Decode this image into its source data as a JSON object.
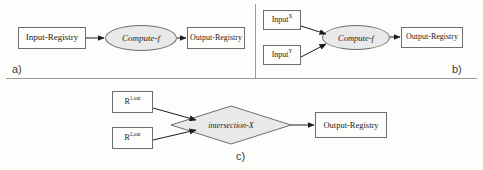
{
  "figure": {
    "background_color": "#fdfdfc",
    "stroke_color": "#6e6e6e",
    "fill_gray": "#e9e9e9",
    "text_color": "#232323"
  },
  "panels": [
    {
      "id": "a",
      "caption": "a)",
      "nodes": {
        "input_registry": "Input-Registry",
        "compute": "Compute-f",
        "output_registry": "Output-Registry"
      }
    },
    {
      "id": "b",
      "caption": "b)",
      "nodes": {
        "input_x_base": "Input",
        "input_x_sup": "X",
        "input_y_base": "Input",
        "input_y_sup": "Y",
        "compute": "Compute-f",
        "output_registry": "Output-Registry"
      }
    },
    {
      "id": "c",
      "caption": "c)",
      "nodes": {
        "r1_base": "R",
        "r1_sup": "1,out",
        "r2_base": "R",
        "r2_sup": "2,out",
        "intersection": "intersection-X",
        "output_registry": "Output-Registry"
      }
    }
  ]
}
